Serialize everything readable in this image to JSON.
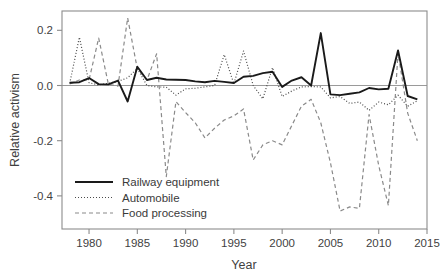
{
  "figure": {
    "title": "",
    "background_color": "#ffffff",
    "frame_color": "#8c8c8c"
  },
  "axes": {
    "xlabel": "Year",
    "ylabel": "Relative activism",
    "x_ticks": [
      "1980",
      "1985",
      "1990",
      "1995",
      "2000",
      "2005",
      "2010",
      "2015"
    ],
    "y_ticks": [
      "0.2",
      "0.0",
      "-0.2",
      "-0.4"
    ]
  },
  "legend": {
    "entries": [
      {
        "label": "Railway equipment",
        "style": "solid",
        "color": "#1a1a1a"
      },
      {
        "label": "Automobile",
        "style": "dotted",
        "color": "#4a4a4a"
      },
      {
        "label": "Food processing",
        "style": "dashed",
        "color": "#8a8a8a"
      }
    ]
  },
  "chart_data": {
    "type": "line",
    "title": "",
    "xlabel": "Year",
    "ylabel": "Relative activism",
    "xlim": [
      1977.2,
      2015
    ],
    "ylim": [
      -0.52,
      0.27
    ],
    "grid": false,
    "legend_position": "lower-left",
    "zero_reference_line": 0.0,
    "x": [
      1978,
      1979,
      1980,
      1981,
      1982,
      1983,
      1984,
      1985,
      1986,
      1987,
      1988,
      1989,
      1990,
      1991,
      1992,
      1993,
      1994,
      1995,
      1996,
      1997,
      1998,
      1999,
      2000,
      2001,
      2002,
      2003,
      2004,
      2005,
      2006,
      2007,
      2008,
      2009,
      2010,
      2011,
      2012,
      2013,
      2014
    ],
    "series": [
      {
        "name": "Railway equipment",
        "style": "solid",
        "color": "#1a1a1a",
        "values": [
          0.01,
          0.012,
          0.027,
          0.005,
          0.004,
          0.018,
          -0.058,
          0.068,
          0.02,
          0.028,
          0.022,
          0.021,
          0.02,
          0.015,
          0.012,
          0.017,
          0.013,
          0.009,
          0.032,
          0.035,
          0.045,
          0.05,
          -0.005,
          0.018,
          0.03,
          0.0,
          0.19,
          -0.032,
          -0.035,
          -0.03,
          -0.025,
          -0.009,
          -0.014,
          -0.012,
          0.127,
          -0.038,
          -0.05
        ]
      },
      {
        "name": "Automobile",
        "style": "dotted",
        "color": "#4a4a4a",
        "values": [
          0.008,
          0.175,
          0.01,
          0.002,
          0.008,
          0.015,
          0.028,
          0.062,
          0.0,
          -0.005,
          -0.006,
          -0.035,
          -0.012,
          -0.01,
          -0.005,
          0.0,
          0.112,
          0.006,
          0.125,
          0.0,
          -0.048,
          0.065,
          -0.04,
          -0.02,
          -0.005,
          -0.004,
          -0.005,
          -0.045,
          -0.04,
          -0.065,
          -0.06,
          -0.09,
          -0.06,
          -0.07,
          -0.035,
          -0.075,
          -0.055
        ]
      },
      {
        "name": "Food processing",
        "style": "dashed",
        "color": "#8a8a8a",
        "values": [
          0.006,
          0.02,
          0.02,
          0.172,
          0.005,
          -0.002,
          0.245,
          0.06,
          0.02,
          0.115,
          -0.33,
          -0.058,
          -0.098,
          -0.135,
          -0.19,
          -0.155,
          -0.125,
          -0.11,
          -0.085,
          -0.27,
          -0.215,
          -0.2,
          -0.215,
          -0.145,
          -0.075,
          -0.05,
          -0.135,
          -0.28,
          -0.455,
          -0.44,
          -0.445,
          -0.105,
          -0.29,
          -0.435,
          0.118,
          -0.1,
          -0.2
        ]
      }
    ]
  }
}
